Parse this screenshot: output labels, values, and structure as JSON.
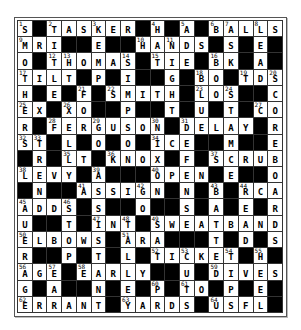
{
  "puzzle": {
    "rows": 18,
    "cols": 18,
    "grid": [
      "S#TASKER#H#A#BALLS",
      "MRI##E##HANDS#S#E#",
      "O#THOMAS#TIE#BK#A#",
      "TILT#P#I##G#BO#TDS",
      "H#E#F#SMITH#LOS##C",
      "EX#XO##P##T#U#T#CO",
      "R#FERGUSON#DELAY#R",
      "ST#L#O#O#ICE##M##E",
      "#R#LT#KNOX#F#SCRUB",
      "LEVY#A###OPEN#E##O",
      "#N##ASSIGN#N#B#RCA",
      "ADDS#S##O##S#A#E#R",
      "U##T#INT#SWEATBAND",
      "ELBOWS#ARA###T#D#S",
      "R##P#T#L#TICKET#H#",
      "AGE#EARLY##U#DIVES",
      "G#A##N#E#P#TO#P#E#",
      "ERRANT#YARDS#USFL#"
    ],
    "numbers": [
      {
        "r": 0,
        "c": 0,
        "n": "1"
      },
      {
        "r": 0,
        "c": 2,
        "n": "2"
      },
      {
        "r": 0,
        "c": 5,
        "n": "3"
      },
      {
        "r": 0,
        "c": 9,
        "n": "4"
      },
      {
        "r": 0,
        "c": 11,
        "n": "5"
      },
      {
        "r": 0,
        "c": 13,
        "n": "6"
      },
      {
        "r": 0,
        "c": 14,
        "n": "7"
      },
      {
        "r": 0,
        "c": 16,
        "n": "8"
      },
      {
        "r": 1,
        "c": 0,
        "n": "9"
      },
      {
        "r": 1,
        "c": 8,
        "n": "10"
      },
      {
        "r": 1,
        "c": 10,
        "n": "11"
      },
      {
        "r": 2,
        "c": 2,
        "n": "12"
      },
      {
        "r": 2,
        "c": 3,
        "n": "13"
      },
      {
        "r": 2,
        "c": 7,
        "n": "14"
      },
      {
        "r": 2,
        "c": 9,
        "n": "15"
      },
      {
        "r": 2,
        "c": 13,
        "n": "16"
      },
      {
        "r": 3,
        "c": 0,
        "n": "17"
      },
      {
        "r": 3,
        "c": 12,
        "n": "18"
      },
      {
        "r": 3,
        "c": 15,
        "n": "19"
      },
      {
        "r": 3,
        "c": 17,
        "n": "20"
      },
      {
        "r": 4,
        "c": 4,
        "n": "21"
      },
      {
        "r": 4,
        "c": 6,
        "n": "22"
      },
      {
        "r": 4,
        "c": 12,
        "n": "23"
      },
      {
        "r": 4,
        "c": 14,
        "n": "24"
      },
      {
        "r": 5,
        "c": 0,
        "n": "25"
      },
      {
        "r": 5,
        "c": 3,
        "n": "26"
      },
      {
        "r": 5,
        "c": 16,
        "n": "27"
      },
      {
        "r": 6,
        "c": 2,
        "n": "28"
      },
      {
        "r": 6,
        "c": 5,
        "n": "29"
      },
      {
        "r": 6,
        "c": 9,
        "n": "30"
      },
      {
        "r": 6,
        "c": 11,
        "n": "31"
      },
      {
        "r": 7,
        "c": 0,
        "n": "32"
      },
      {
        "r": 7,
        "c": 1,
        "n": "33"
      },
      {
        "r": 7,
        "c": 9,
        "n": "34"
      },
      {
        "r": 8,
        "c": 3,
        "n": "35"
      },
      {
        "r": 8,
        "c": 6,
        "n": "36"
      },
      {
        "r": 8,
        "c": 13,
        "n": "37"
      },
      {
        "r": 9,
        "c": 0,
        "n": "38"
      },
      {
        "r": 9,
        "c": 5,
        "n": "39"
      },
      {
        "r": 9,
        "c": 9,
        "n": "40"
      },
      {
        "r": 10,
        "c": 4,
        "n": "41"
      },
      {
        "r": 10,
        "c": 8,
        "n": "42"
      },
      {
        "r": 10,
        "c": 13,
        "n": "43"
      },
      {
        "r": 10,
        "c": 15,
        "n": "44"
      },
      {
        "r": 11,
        "c": 0,
        "n": "45"
      },
      {
        "r": 11,
        "c": 3,
        "n": "46"
      },
      {
        "r": 12,
        "c": 5,
        "n": "47"
      },
      {
        "r": 12,
        "c": 7,
        "n": "48"
      },
      {
        "r": 12,
        "c": 9,
        "n": "49"
      },
      {
        "r": 13,
        "c": 0,
        "n": "50"
      },
      {
        "r": 13,
        "c": 7,
        "n": "51"
      },
      {
        "r": 14,
        "c": 9,
        "n": "52"
      },
      {
        "r": 14,
        "c": 11,
        "n": "53"
      },
      {
        "r": 14,
        "c": 14,
        "n": "54"
      },
      {
        "r": 14,
        "c": 16,
        "n": "55"
      },
      {
        "r": 15,
        "c": 0,
        "n": "56"
      },
      {
        "r": 15,
        "c": 2,
        "n": "57"
      },
      {
        "r": 15,
        "c": 4,
        "n": "58"
      },
      {
        "r": 15,
        "c": 13,
        "n": "59"
      },
      {
        "r": 16,
        "c": 9,
        "n": "60"
      },
      {
        "r": 16,
        "c": 11,
        "n": "61"
      },
      {
        "r": 17,
        "c": 0,
        "n": "62"
      },
      {
        "r": 17,
        "c": 7,
        "n": "63"
      },
      {
        "r": 17,
        "c": 13,
        "n": "64"
      }
    ]
  },
  "colors": {
    "block": "#000000",
    "cell": "#ffffff",
    "line": "#333333"
  }
}
